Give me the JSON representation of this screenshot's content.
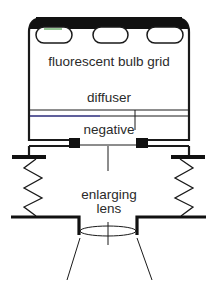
{
  "diagram": {
    "type": "enlarger-light-source-schematic",
    "labels": {
      "bulbs": "fluorescent bulb grid",
      "diffuser": "diffuser",
      "negative": "negative",
      "lens_line1": "enlarging",
      "lens_line2": "lens"
    },
    "colors": {
      "stroke": "#1a1a1a",
      "housing_top": "#111111",
      "bulb_accent": "#2a8a2a",
      "diffuser_accent": "#3333aa",
      "text": "#2a2a2a",
      "background": "#ffffff"
    },
    "components": [
      {
        "name": "fluorescent bulb grid",
        "count": 3
      },
      {
        "name": "diffuser"
      },
      {
        "name": "negative"
      },
      {
        "name": "bellows",
        "sides": 2
      },
      {
        "name": "enlarging lens"
      }
    ]
  }
}
